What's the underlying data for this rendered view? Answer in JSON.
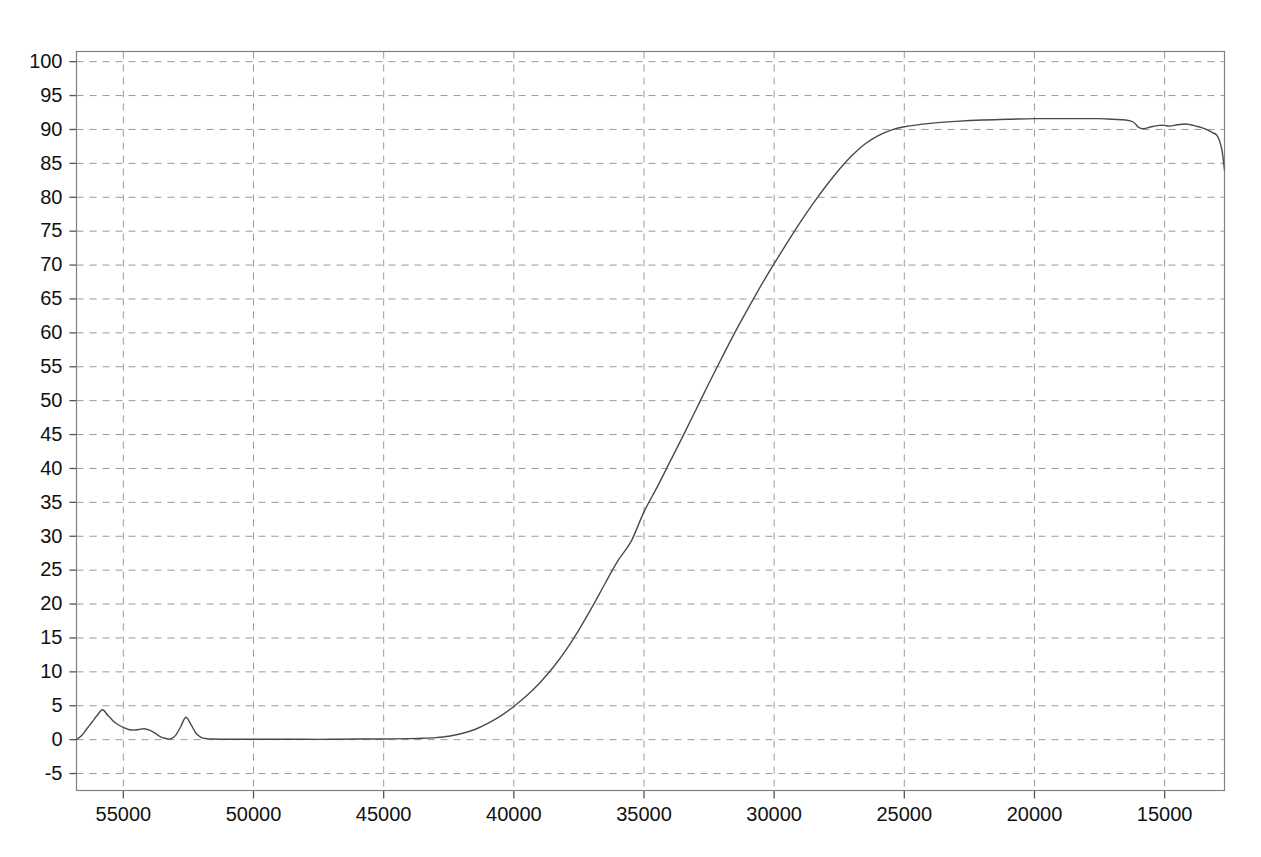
{
  "chart_data": {
    "type": "line",
    "title": "",
    "subtitle": "",
    "xlabel": "",
    "ylabel": "",
    "grid": true,
    "legend": "none",
    "x_axis": {
      "reversed": true,
      "ticks": [
        55000,
        50000,
        45000,
        40000,
        35000,
        30000,
        25000,
        20000,
        15000
      ],
      "tick_labels": [
        "55000",
        "50000",
        "45000",
        "40000",
        "35000",
        "30000",
        "25000",
        "20000",
        "15000"
      ],
      "xlim": [
        56800,
        12700
      ],
      "minor_step": 5000
    },
    "y_axis": {
      "ticks": [
        -5,
        0,
        5,
        10,
        15,
        20,
        25,
        30,
        35,
        40,
        45,
        50,
        55,
        60,
        65,
        70,
        75,
        80,
        85,
        90,
        95,
        100
      ],
      "tick_labels": [
        "-5",
        "0",
        "5",
        "10",
        "15",
        "20",
        "25",
        "30",
        "35",
        "40",
        "45",
        "50",
        "55",
        "60",
        "65",
        "70",
        "75",
        "80",
        "85",
        "90",
        "95",
        "100"
      ],
      "ylim": [
        -7.5,
        101.5
      ],
      "step": 5
    },
    "series": [
      {
        "name": "transmittance",
        "color": "#4a4a4a",
        "line_width": 1.4,
        "x": [
          56800,
          56600,
          56400,
          56200,
          56000,
          55800,
          55600,
          55400,
          55200,
          55000,
          54800,
          54600,
          54400,
          54200,
          54000,
          53800,
          53600,
          53400,
          53200,
          53000,
          52800,
          52600,
          52400,
          52200,
          52000,
          51800,
          51600,
          51000,
          50000,
          49000,
          48000,
          47000,
          46000,
          45000,
          44000,
          43500,
          43000,
          42500,
          42000,
          41500,
          41000,
          40500,
          40000,
          39500,
          39000,
          38500,
          38000,
          37500,
          37000,
          36500,
          36000,
          35500,
          35000,
          34500,
          34000,
          33500,
          33000,
          32500,
          32000,
          31500,
          31000,
          30500,
          30000,
          29500,
          29000,
          28500,
          28000,
          27500,
          27000,
          26500,
          26000,
          25500,
          25000,
          24000,
          23000,
          22000,
          21000,
          20000,
          19000,
          18000,
          17500,
          17000,
          16500,
          16200,
          16000,
          15800,
          15500,
          15200,
          15000,
          14800,
          14500,
          14200,
          14000,
          13800,
          13600,
          13400,
          13200,
          13000,
          12900,
          12800,
          12750,
          12700
        ],
        "y": [
          0.0,
          0.6,
          1.6,
          2.6,
          3.6,
          4.4,
          3.6,
          2.8,
          2.2,
          1.8,
          1.5,
          1.4,
          1.5,
          1.6,
          1.4,
          1.0,
          0.5,
          0.2,
          0.1,
          0.6,
          1.9,
          3.3,
          2.2,
          0.9,
          0.3,
          0.15,
          0.1,
          0.05,
          0.05,
          0.05,
          0.05,
          0.05,
          0.1,
          0.1,
          0.15,
          0.2,
          0.3,
          0.5,
          0.9,
          1.5,
          2.4,
          3.5,
          4.9,
          6.5,
          8.4,
          10.6,
          13.2,
          16.2,
          19.5,
          23.0,
          26.4,
          29.2,
          33.6,
          37.2,
          41.0,
          44.8,
          48.7,
          52.6,
          56.4,
          60.1,
          63.6,
          67.0,
          70.2,
          73.3,
          76.3,
          79.1,
          81.7,
          84.1,
          86.2,
          87.9,
          89.1,
          89.9,
          90.4,
          90.9,
          91.2,
          91.4,
          91.5,
          91.6,
          91.6,
          91.6,
          91.6,
          91.5,
          91.4,
          91.1,
          90.3,
          90.1,
          90.4,
          90.6,
          90.6,
          90.5,
          90.7,
          90.8,
          90.7,
          90.5,
          90.3,
          90.0,
          89.6,
          89.2,
          88.4,
          87.0,
          85.6,
          84.0
        ]
      }
    ]
  },
  "axes": {
    "frame_color": "#808080",
    "grid_color": "#9a9a9a",
    "tick_color": "#555555",
    "background": "#ffffff"
  }
}
